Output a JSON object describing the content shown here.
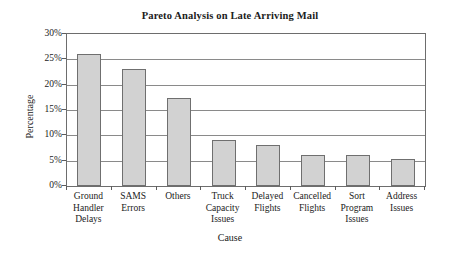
{
  "chart_data": {
    "type": "bar",
    "title": "Pareto Analysis on Late Arriving Mail",
    "xlabel": "Cause",
    "ylabel": "Percentage",
    "categories": [
      "Ground Handler Delays",
      "SAMS Errors",
      "Others",
      "Truck Capacity Issues",
      "Delayed Flights",
      "Cancelled Flights",
      "Sort Program Issues",
      "Address Issues"
    ],
    "category_lines": [
      [
        "Ground",
        "Handler",
        "Delays"
      ],
      [
        "SAMS",
        "Errors"
      ],
      [
        "Others"
      ],
      [
        "Truck",
        "Capacity",
        "Issues"
      ],
      [
        "Delayed",
        "Flights"
      ],
      [
        "Cancelled",
        "Flights"
      ],
      [
        "Sort",
        "Program",
        "Issues"
      ],
      [
        "Address",
        "Issues"
      ]
    ],
    "values": [
      26,
      23,
      17.3,
      9,
      8,
      6.2,
      6.2,
      5.3
    ],
    "value_labels": [
      "26%",
      "23%",
      "17.3%",
      "9%",
      "8%",
      "6.2%",
      "6.2%",
      "5.3%"
    ],
    "ylim": [
      0,
      30
    ],
    "ytick_values": [
      30,
      25,
      20,
      15,
      10,
      5,
      0
    ],
    "ytick_labels": [
      "30%",
      "25%",
      "20%",
      "15%",
      "10%",
      "5%",
      "0%"
    ],
    "grid": "horizontal",
    "legend": "none",
    "colors": {
      "bar_fill": "#d2d2d2",
      "bar_border": "#6f6f6f",
      "gridline": "#8a8a8a",
      "frame": "#6d6d6d",
      "text": "#1b1b1b",
      "background": "#ffffff"
    }
  }
}
